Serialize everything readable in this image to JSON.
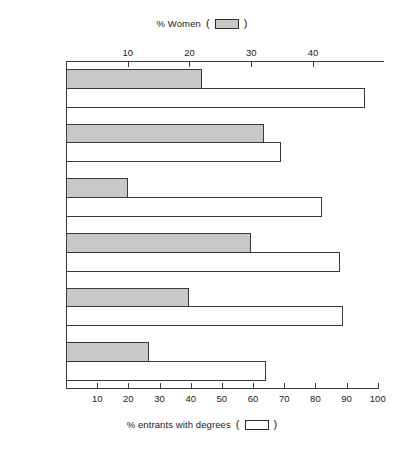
{
  "legends": {
    "top": {
      "label": "% Women",
      "open_paren": "(",
      "close_paren": ")",
      "swatch": "filled-gray-rectangle"
    },
    "bottom": {
      "label": "% entrants with degrees",
      "open_paren": "(",
      "close_paren": ")",
      "swatch": "open-white-rectangle"
    }
  },
  "chart_data": {
    "type": "bar",
    "orientation": "horizontal",
    "title": "",
    "categories": [
      "LBS",
      "Durham",
      "Cranfield",
      "City",
      "Bradford",
      "Aston"
    ],
    "series": [
      {
        "name": "% Women",
        "axis": "top",
        "color": "#c8c8c8",
        "values": [
          22,
          32,
          10,
          30,
          20,
          13.5
        ]
      },
      {
        "name": "% entrants with degrees",
        "axis": "bottom",
        "color": "#ffffff",
        "values": [
          96,
          69,
          82,
          88,
          89,
          64
        ]
      }
    ],
    "axes": {
      "top": {
        "label": "% Women",
        "ticks": [
          10,
          20,
          30,
          40
        ],
        "tick_labels": [
          "10",
          "20",
          "30",
          "40"
        ],
        "range": [
          0,
          51.5
        ]
      },
      "bottom": {
        "label": "% entrants with degrees",
        "ticks": [
          10,
          20,
          30,
          40,
          50,
          60,
          70,
          80,
          90,
          100
        ],
        "tick_labels": [
          "10",
          "20",
          "30",
          "40",
          "50",
          "60",
          "70",
          "80",
          "90",
          "100"
        ],
        "range": [
          0,
          102
        ]
      }
    },
    "grid": false,
    "legend_position": "top-and-bottom-center"
  }
}
